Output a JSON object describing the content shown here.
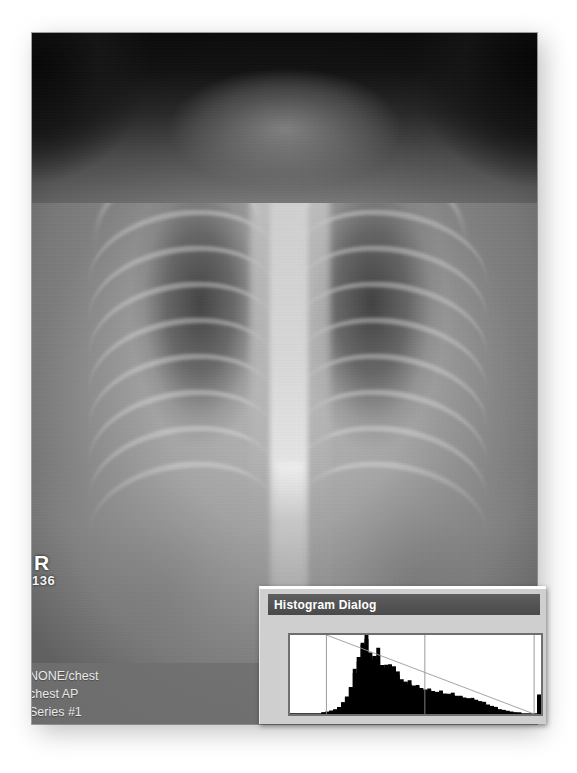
{
  "viewer": {
    "modality_hint": "radiograph",
    "laterality_marker": "R",
    "marker_number": "136",
    "study_info": {
      "line1": "NONE/chest",
      "line2": "chest AP",
      "line3": "Series #1"
    }
  },
  "dialog": {
    "title": "Histogram Dialog",
    "titlebar_color": "#545454",
    "body_color": "#cfcfcf",
    "plot_border_color": "#6f6f6f",
    "plot_background": "#ffffff"
  },
  "chart_data": {
    "type": "bar",
    "title": "Histogram Dialog",
    "xlabel": "",
    "ylabel": "",
    "grid": false,
    "legend": false,
    "axis_visible": false,
    "xlim": [
      0,
      255
    ],
    "ylim": [
      0,
      100
    ],
    "bin_width": 1,
    "fill_color": "#000000",
    "categories": [
      "0",
      "4",
      "8",
      "12",
      "16",
      "20",
      "24",
      "28",
      "32",
      "36",
      "40",
      "44",
      "48",
      "52",
      "56",
      "60",
      "64",
      "68",
      "72",
      "76",
      "80",
      "84",
      "88",
      "92",
      "96",
      "100",
      "104",
      "108",
      "112",
      "116",
      "120",
      "124",
      "128",
      "132",
      "136",
      "140",
      "144",
      "148",
      "152",
      "156",
      "160",
      "164",
      "168",
      "172",
      "176",
      "180",
      "184",
      "188",
      "192",
      "196",
      "200",
      "204",
      "208",
      "212",
      "216",
      "220",
      "224",
      "228",
      "232",
      "236",
      "240",
      "244",
      "248",
      "252"
    ],
    "values": [
      1,
      1,
      1,
      1,
      1,
      1,
      1,
      1,
      2,
      3,
      4,
      6,
      9,
      14,
      22,
      34,
      52,
      72,
      88,
      95,
      78,
      70,
      84,
      62,
      58,
      63,
      60,
      49,
      44,
      40,
      38,
      36,
      35,
      33,
      31,
      30,
      29,
      28,
      27,
      26,
      25,
      24,
      23,
      22,
      21,
      20,
      19,
      18,
      16,
      14,
      12,
      10,
      8,
      6,
      5,
      4,
      3,
      2,
      2,
      1,
      1,
      1,
      1,
      22
    ],
    "markers": {
      "vertical_lines": [
        {
          "name": "window-low-marker",
          "x": 37,
          "color": "#8d8d8d"
        },
        {
          "name": "window-high-marker",
          "x": 137,
          "color": "#8d8d8d"
        },
        {
          "name": "right-edge-marker",
          "x": 248,
          "color": "#8d8d8d"
        }
      ],
      "lut_line": {
        "name": "lut-ramp",
        "color": "#9a9a9a",
        "from": {
          "x": 37,
          "y": 100
        },
        "to": {
          "x": 248,
          "y": 0
        }
      }
    },
    "annotations": [
      "Black-filled intensity histogram with sharp low-midtone peak",
      "Descending linear LUT ramp overlaid",
      "Saturated-white spike at far right bin"
    ]
  }
}
